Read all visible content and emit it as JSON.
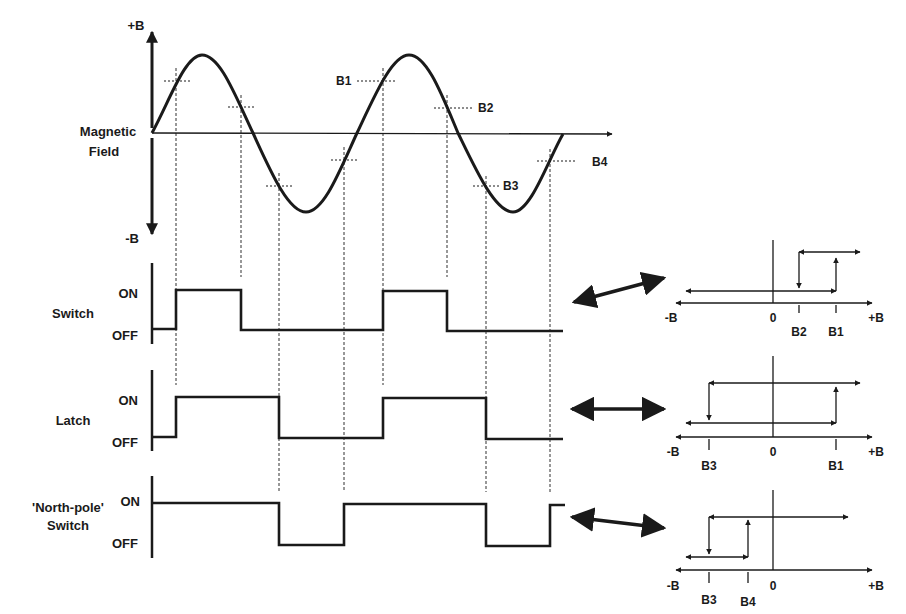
{
  "field": {
    "plus_b": "+B",
    "minus_b": "-B",
    "title_line1": "Magnetic",
    "title_line2": "Field",
    "thresholds": [
      {
        "label": "B1",
        "x": 383,
        "y": 81
      },
      {
        "label": "B2",
        "x": 447,
        "y": 107
      },
      {
        "label": "B3",
        "x": 486,
        "y": 186
      },
      {
        "label": "B4",
        "x": 550,
        "y": 161
      }
    ]
  },
  "rows": [
    {
      "name": "Switch",
      "label_line1": "Switch",
      "label_line2": "",
      "on": "ON",
      "off": "OFF"
    },
    {
      "name": "Latch",
      "label_line1": "Latch",
      "label_line2": "",
      "on": "ON",
      "off": "OFF"
    },
    {
      "name": "North-pole Switch",
      "label_line1": "'North-pole'",
      "label_line2": "Switch",
      "on": "ON",
      "off": "OFF"
    }
  ],
  "hysteresis": [
    {
      "minus": "-B",
      "zero": "0",
      "plus": "+B",
      "ticks": [
        "B2",
        "B1"
      ]
    },
    {
      "minus": "-B",
      "zero": "0",
      "plus": "+B",
      "ticks": [
        "B3",
        "B1"
      ]
    },
    {
      "minus": "-B",
      "zero": "0",
      "plus": "+B",
      "ticks": [
        "B3",
        "B4"
      ]
    }
  ],
  "colors": {
    "ink": "#1a1a1a",
    "background": "#ffffff"
  }
}
